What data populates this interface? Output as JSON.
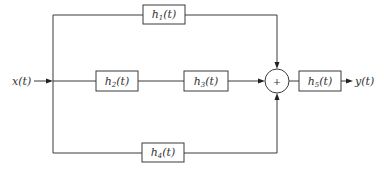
{
  "diagram": {
    "input": {
      "label": "x(t)"
    },
    "output": {
      "label": "y(t)"
    },
    "blocks": [
      {
        "id": "h1",
        "base": "h",
        "sub": "1",
        "arg": "(t)",
        "path": "top"
      },
      {
        "id": "h2",
        "base": "h",
        "sub": "2",
        "arg": "(t)",
        "path": "middle"
      },
      {
        "id": "h3",
        "base": "h",
        "sub": "3",
        "arg": "(t)",
        "path": "middle"
      },
      {
        "id": "h4",
        "base": "h",
        "sub": "4",
        "arg": "(t)",
        "path": "bottom"
      },
      {
        "id": "h5",
        "base": "h",
        "sub": "5",
        "arg": "(t)",
        "path": "output"
      }
    ],
    "summer": {
      "symbol": "+"
    },
    "connections": [
      "x(t) -> h1 -> summer",
      "x(t) -> h2 -> h3 -> summer",
      "x(t) -> h4 -> summer",
      "summer -> h5 -> y(t)"
    ]
  }
}
